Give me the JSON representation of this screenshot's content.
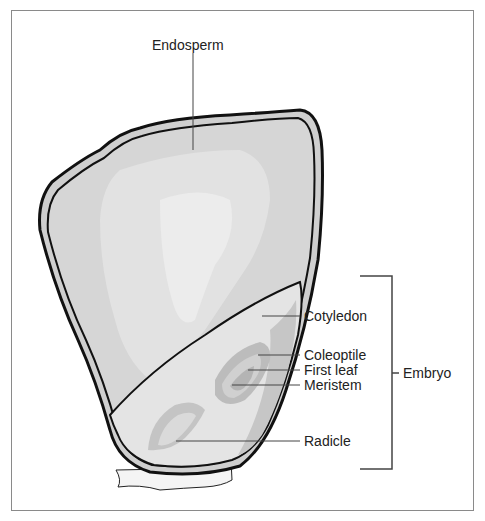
{
  "diagram": {
    "labels": {
      "endosperm": "Endosperm",
      "cotyledon": "Cotyledon",
      "coleoptile": "Coleoptile",
      "first_leaf": "First leaf",
      "meristem": "Meristem",
      "radicle": "Radicle",
      "embryo": "Embryo"
    },
    "colors": {
      "outline": "#111111",
      "seed_coat": "#cfcfcf",
      "endosperm_fill": "#d6d6d6",
      "endosperm_highlight": "#e6e6e6",
      "embryo_fill": "#e4e4e4",
      "embryo_structures": "#b8b8b8",
      "leader_line": "#444444",
      "frame": "#8a8a8a"
    }
  }
}
